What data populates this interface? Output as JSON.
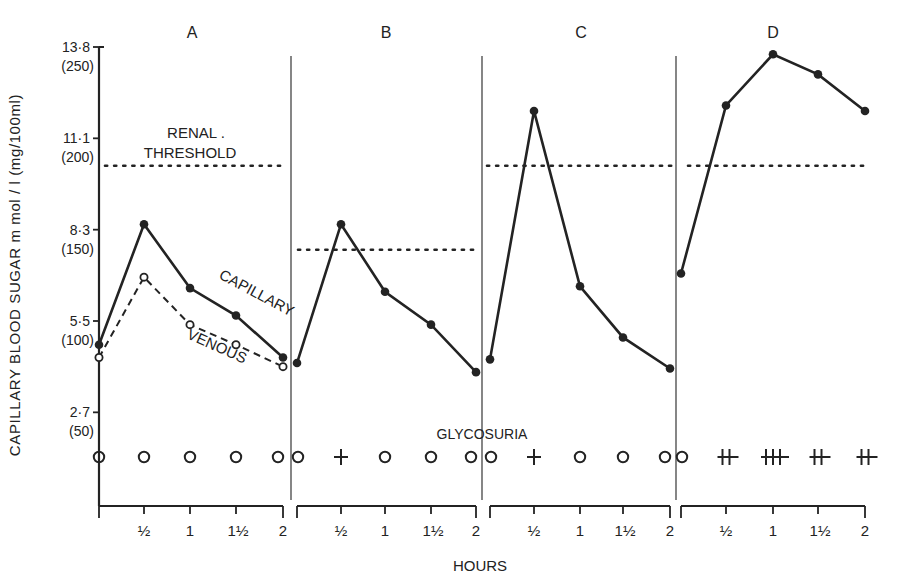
{
  "chart_data": {
    "type": "line",
    "title": "",
    "xlabel": "HOURS",
    "ylabel": "CAPILLARY BLOOD SUGAR m mol / l (mg/100ml)",
    "ylim_mg": [
      0,
      250
    ],
    "y_ticks": [
      {
        "mmol": "13·8",
        "mg": "(250)",
        "value_mg": 250
      },
      {
        "mmol": "11·1",
        "mg": "(200)",
        "value_mg": 200
      },
      {
        "mmol": "8·3",
        "mg": "(150)",
        "value_mg": 150
      },
      {
        "mmol": "5·5",
        "mg": "(100)",
        "value_mg": 100
      },
      {
        "mmol": "2·7",
        "mg": "(50)",
        "value_mg": 50
      }
    ],
    "x_tick_labels": [
      "",
      "½",
      "1",
      "1½",
      "2"
    ],
    "x_hours": [
      0,
      0.5,
      1,
      1.5,
      2
    ],
    "grid": false,
    "annotations": {
      "renal_threshold_line1": "RENAL .",
      "renal_threshold_line2": "THRESHOLD",
      "glycosuria": "GLYCOSURIA",
      "capillary": "CAPILLARY",
      "venous": "VENOUS"
    },
    "panels": [
      {
        "label": "A",
        "renal_threshold_mg": 185,
        "series": [
          {
            "name": "CAPILLARY",
            "style": "solid",
            "marker": "filled",
            "values_mg": [
              87,
              153,
              118,
              103,
              80
            ]
          },
          {
            "name": "VENOUS",
            "style": "dashed",
            "marker": "open",
            "values_mg": [
              80,
              124,
              98,
              87,
              75
            ]
          }
        ],
        "glycosuria": [
          "o",
          "o",
          "o",
          "o",
          "o"
        ]
      },
      {
        "label": "B",
        "renal_threshold_mg": 139,
        "series": [
          {
            "name": "CAPILLARY",
            "style": "solid",
            "marker": "filled",
            "values_mg": [
              77,
              153,
              116,
              98,
              72
            ]
          }
        ],
        "glycosuria": [
          "o",
          "+",
          "o",
          "o",
          "o"
        ]
      },
      {
        "label": "C",
        "renal_threshold_mg": 185,
        "series": [
          {
            "name": "CAPILLARY",
            "style": "solid",
            "marker": "filled",
            "values_mg": [
              79,
              215,
              119,
              91,
              74
            ]
          }
        ],
        "glycosuria": [
          "o",
          "+",
          "o",
          "o",
          "o"
        ]
      },
      {
        "label": "D",
        "renal_threshold_mg": 185,
        "series": [
          {
            "name": "CAPILLARY",
            "style": "solid",
            "marker": "filled",
            "values_mg": [
              126,
              218,
              246,
              235,
              215
            ]
          }
        ],
        "glycosuria": [
          "o",
          "++",
          "+++",
          "++",
          "++"
        ]
      }
    ]
  }
}
